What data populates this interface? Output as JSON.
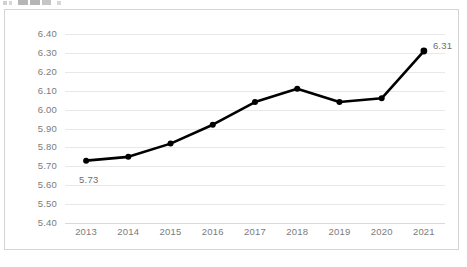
{
  "chart_data": {
    "type": "line",
    "title": "",
    "subtitle": "",
    "xlabel": "",
    "ylabel": "",
    "categories": [
      "2013",
      "2014",
      "2015",
      "2016",
      "2017",
      "2018",
      "2019",
      "2020",
      "2021"
    ],
    "values": [
      5.73,
      5.75,
      5.82,
      5.92,
      6.04,
      6.11,
      6.04,
      6.06,
      6.31
    ],
    "series": [
      {
        "name": "",
        "values": [
          5.73,
          5.75,
          5.82,
          5.92,
          6.04,
          6.11,
          6.04,
          6.06,
          6.31
        ]
      }
    ],
    "ylim": [
      5.4,
      6.4
    ],
    "ytick_step": 0.1,
    "ytick_labels": [
      "6.40",
      "6.30",
      "6.20",
      "6.10",
      "6.00",
      "5.90",
      "5.80",
      "5.70",
      "5.60",
      "5.50",
      "5.40"
    ],
    "ytick_values": [
      6.4,
      6.3,
      6.2,
      6.1,
      6.0,
      5.9,
      5.8,
      5.7,
      5.6,
      5.5,
      5.4
    ],
    "grid": true,
    "legend": false,
    "legend_position": "none",
    "data_labels": [
      {
        "category": "2013",
        "value": 5.73,
        "text": "5.73",
        "position": "below"
      },
      {
        "category": "2021",
        "value": 6.31,
        "text": "6.31",
        "position": "right"
      }
    ],
    "marker": "circle",
    "colors": {
      "line": "#000000",
      "marker": "#000000",
      "gridline": "#e8e8e8",
      "axis": "#d9d9d9",
      "tick_text": "#7b7b7b",
      "label_text": "#6f6f6f",
      "frame": "#d4d4d4",
      "background": "#ffffff"
    }
  },
  "frame": {
    "border_color": "#d4d4d4"
  },
  "topstrip": {
    "description": "cut-off toolbar icons"
  }
}
